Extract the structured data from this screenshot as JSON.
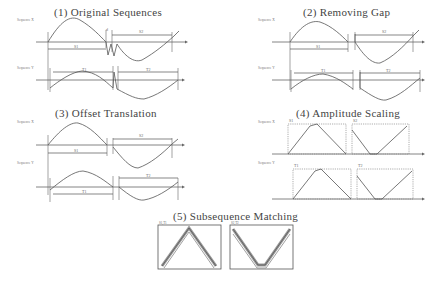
{
  "figure": {
    "panels": [
      {
        "id": "original",
        "title": "(1) Original Sequences",
        "seq_x_label": "Sequence X",
        "seq_y_label": "Sequence Y",
        "x_sub": [
          "S1",
          "S2"
        ],
        "y_sub": [
          "T1",
          "T2"
        ]
      },
      {
        "id": "removing-gap",
        "title": "(2) Removing Gap",
        "seq_x_label": "Sequence X",
        "seq_y_label": "Sequence Y",
        "x_sub": [
          "S1",
          "S2"
        ],
        "y_sub": [
          "T1",
          "T2"
        ]
      },
      {
        "id": "offset-translation",
        "title": "(3) Offset Translation",
        "seq_x_label": "Sequence X",
        "seq_y_label": "Sequence Y",
        "x_sub": [
          "S1",
          "S2"
        ],
        "y_sub": [
          "T1",
          "T2"
        ]
      },
      {
        "id": "amplitude-scaling",
        "title": "(4) Amplitude Scaling",
        "seq_x_label": "Sequence X",
        "seq_y_label": "Sequence Y",
        "x_sub": [
          "S1",
          "S2"
        ],
        "y_sub": [
          "T1",
          "T2"
        ]
      },
      {
        "id": "subsequence-matching",
        "title": "(5) Subsequence Matching",
        "box_labels": [
          "S1,T1",
          "S2,T2"
        ]
      }
    ]
  }
}
